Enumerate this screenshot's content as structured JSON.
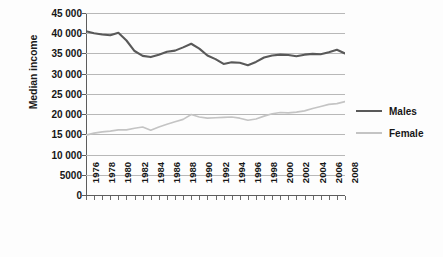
{
  "chart_data": {
    "type": "line",
    "title": "",
    "xlabel": "",
    "ylabel": "Median income",
    "ylim": [
      0,
      45000
    ],
    "xlim": [
      1976,
      2008
    ],
    "y_ticks": [
      "0",
      "5000",
      "10 000",
      "15 000",
      "20 000",
      "25 000",
      "30 000",
      "35 000",
      "40 000",
      "45 000"
    ],
    "y_tick_values": [
      0,
      5000,
      10000,
      15000,
      20000,
      25000,
      30000,
      35000,
      40000,
      45000
    ],
    "x_tick_labels": [
      "1976",
      "1978",
      "1980",
      "1982",
      "1984",
      "1986",
      "1988",
      "1990",
      "1992",
      "1994",
      "1996",
      "1998",
      "2000",
      "2002",
      "2004",
      "2006",
      "2008"
    ],
    "x": [
      1976,
      1977,
      1978,
      1979,
      1980,
      1981,
      1982,
      1983,
      1984,
      1985,
      1986,
      1987,
      1988,
      1989,
      1990,
      1991,
      1992,
      1993,
      1994,
      1995,
      1996,
      1997,
      1998,
      1999,
      2000,
      2001,
      2002,
      2003,
      2004,
      2005,
      2006,
      2007,
      2008
    ],
    "grid": true,
    "legend_position": "right",
    "series": [
      {
        "name": "Males",
        "color": "#595959",
        "width": 2.1,
        "values": [
          40500,
          40000,
          39700,
          39500,
          40100,
          38200,
          35600,
          34400,
          34100,
          34700,
          35400,
          35700,
          36500,
          37400,
          36200,
          34500,
          33600,
          32400,
          32800,
          32700,
          32100,
          32900,
          34000,
          34500,
          34700,
          34600,
          34300,
          34700,
          34900,
          34800,
          35300,
          35900,
          35000
        ]
      },
      {
        "name": "Female",
        "color": "#c4c4c4",
        "width": 1.6,
        "values": [
          14800,
          15300,
          15600,
          15800,
          16100,
          16100,
          16500,
          16800,
          16000,
          16800,
          17500,
          18100,
          18700,
          19900,
          19300,
          19000,
          19100,
          19200,
          19300,
          19000,
          18500,
          18800,
          19500,
          20100,
          20400,
          20300,
          20500,
          20800,
          21400,
          21900,
          22400,
          22600,
          23100
        ]
      }
    ]
  },
  "legend": {
    "items": [
      {
        "label": "Males"
      },
      {
        "label": "Female"
      }
    ]
  }
}
